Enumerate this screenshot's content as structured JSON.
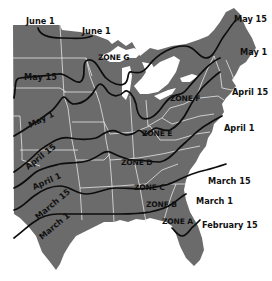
{
  "map": {
    "title": "Average last spring frost dates and planting zones, eastern United States",
    "colors": {
      "land": "#6b6b6b",
      "state_lines": "#e6e6e6",
      "contours": "#0d0d0d",
      "background": "#ffffff",
      "text": "#111111"
    },
    "frost_date_labels": [
      {
        "id": "june1-west",
        "text": "June 1"
      },
      {
        "id": "june1-east",
        "text": "June 1"
      },
      {
        "id": "may15-west",
        "text": "May 15"
      },
      {
        "id": "may15-east",
        "text": "May 15"
      },
      {
        "id": "may1-west",
        "text": "May 1"
      },
      {
        "id": "may1-east",
        "text": "May 1"
      },
      {
        "id": "april15-west",
        "text": "April 15"
      },
      {
        "id": "april15-east",
        "text": "April 15"
      },
      {
        "id": "april1-west",
        "text": "April 1"
      },
      {
        "id": "april1-east",
        "text": "April 1"
      },
      {
        "id": "march15-west",
        "text": "March 15"
      },
      {
        "id": "march15-east",
        "text": "March 15"
      },
      {
        "id": "march1-west",
        "text": "March 1"
      },
      {
        "id": "march1-east",
        "text": "March 1"
      },
      {
        "id": "feb15",
        "text": "February 15"
      }
    ],
    "zones": [
      {
        "id": "zone-g",
        "text": "ZONE G"
      },
      {
        "id": "zone-f",
        "text": "ZONE F"
      },
      {
        "id": "zone-e",
        "text": "ZONE E"
      },
      {
        "id": "zone-d",
        "text": "ZONE D"
      },
      {
        "id": "zone-c",
        "text": "ZONE C"
      },
      {
        "id": "zone-b",
        "text": "ZONE B"
      },
      {
        "id": "zone-a",
        "text": "ZONE A"
      }
    ]
  }
}
